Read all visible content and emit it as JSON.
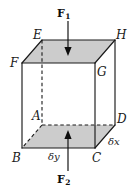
{
  "figure": {
    "canvas": {
      "width": 137,
      "height": 191
    },
    "colors": {
      "face_fill": "#cccccc",
      "stroke": "#1a1a1a",
      "text": "#1a1a1a",
      "background": "#ffffff"
    },
    "vertices": [
      {
        "key": "E",
        "label": "E",
        "x": 42,
        "y": 40,
        "label_x": 33,
        "label_y": 29
      },
      {
        "key": "H",
        "label": "H",
        "x": 115,
        "y": 40,
        "label_x": 116,
        "label_y": 29
      },
      {
        "key": "F",
        "label": "F",
        "x": 22,
        "y": 63,
        "label_x": 10,
        "label_y": 57
      },
      {
        "key": "G",
        "label": "G",
        "x": 95,
        "y": 63,
        "label_x": 97,
        "label_y": 66
      },
      {
        "key": "A",
        "label": "A",
        "x": 42,
        "y": 125,
        "label_x": 32,
        "label_y": 110
      },
      {
        "key": "D",
        "label": "D",
        "x": 115,
        "y": 125,
        "label_x": 117,
        "label_y": 113
      },
      {
        "key": "B",
        "label": "B",
        "x": 22,
        "y": 148,
        "label_x": 12,
        "label_y": 152
      },
      {
        "key": "C",
        "label": "C",
        "x": 95,
        "y": 148,
        "label_x": 92,
        "label_y": 152
      }
    ],
    "dimension_labels": [
      {
        "key": "delta-y",
        "label": "δy",
        "label_x": 48,
        "label_y": 152
      },
      {
        "key": "delta-x",
        "label": "δx",
        "label_x": 108,
        "label_y": 137
      }
    ],
    "forces": [
      {
        "key": "F1",
        "symbol": "F",
        "subscript": "1",
        "direction": "down",
        "label_x": 57,
        "label_y": 8,
        "arrow_x": 68,
        "arrow_y_start": 21,
        "arrow_y_end": 54
      },
      {
        "key": "F2",
        "symbol": "F",
        "subscript": "2",
        "direction": "up",
        "label_x": 57,
        "label_y": 174,
        "arrow_x": 68,
        "arrow_y_start": 171,
        "arrow_y_end": 132
      }
    ],
    "faces": {
      "top": "42,40 115,40 95,63 22,63",
      "bottom": "42,125 115,125 95,148 22,148"
    },
    "solid_edges": [
      "22,63 95,63",
      "95,63 95,148",
      "95,148 22,148",
      "22,148 22,63",
      "22,63 42,40",
      "95,63 115,40",
      "95,148 115,125",
      "42,40 115,40",
      "115,40 115,125",
      "42,40 22,63"
    ],
    "dashed_edges": [
      "42,40 42,125",
      "42,125 22,148",
      "42,125 115,125"
    ]
  }
}
